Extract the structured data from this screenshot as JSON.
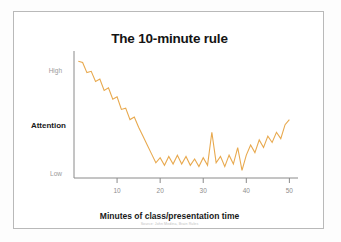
{
  "slide": {
    "background_color": "#ffffff",
    "card_border_color": "#b9b9b9"
  },
  "credit": {
    "text": "Source: John Medina, Brain Rules"
  },
  "chart_data": {
    "type": "line",
    "title": "The 10-minute rule",
    "xlabel": "Minutes of class/presentation time",
    "ylabel": "Attention",
    "grid": false,
    "legend": "none",
    "line_color": "#e8a94e",
    "axis_color": "#8a8a8a",
    "xlim": [
      0,
      52
    ],
    "ylim": [
      0,
      10
    ],
    "xticks": [
      10,
      20,
      30,
      40,
      50
    ],
    "xtick_labels": [
      "10",
      "20",
      "30",
      "40",
      "50"
    ],
    "ytick_labels": [
      "High",
      "Low"
    ],
    "ytick_positions": [
      8.6,
      1.0
    ],
    "x": [
      1,
      2,
      3,
      4,
      5,
      6,
      7,
      8,
      9,
      10,
      11,
      12,
      13,
      14,
      15,
      16,
      17,
      18,
      19,
      20,
      21,
      22,
      23,
      24,
      25,
      26,
      27,
      28,
      29,
      30,
      31,
      32,
      33,
      34,
      35,
      36,
      37,
      38,
      39,
      40,
      41,
      42,
      43,
      44,
      45,
      46,
      47,
      48,
      49,
      50
    ],
    "values": [
      9.2,
      9.1,
      8.3,
      8.4,
      7.6,
      7.8,
      6.9,
      7.1,
      6.2,
      6.4,
      5.4,
      5.5,
      4.6,
      4.8,
      4.0,
      3.3,
      2.6,
      1.9,
      1.2,
      1.6,
      1.0,
      1.7,
      1.1,
      1.8,
      1.1,
      1.7,
      1.0,
      1.5,
      0.9,
      1.6,
      1.0,
      3.6,
      1.2,
      1.7,
      0.9,
      1.8,
      1.1,
      2.4,
      0.6,
      1.9,
      1.1,
      2.5,
      1.0,
      1.8,
      1.2,
      2.0,
      1.0,
      1.9,
      1.2,
      2.2
    ],
    "values_tail": [
      1.8,
      2.6,
      2.0,
      3.0,
      2.4,
      3.3,
      2.8,
      3.6,
      3.1,
      4.2,
      4.6
    ],
    "x_tail": [
      40,
      41,
      42,
      43,
      44,
      45,
      46,
      47,
      48,
      49,
      50
    ]
  }
}
